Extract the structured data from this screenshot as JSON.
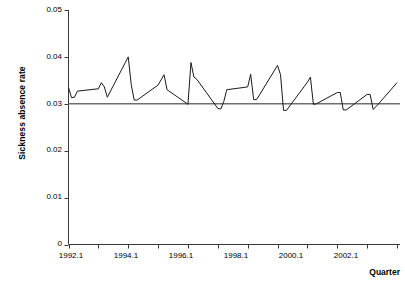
{
  "chart_data": {
    "type": "line",
    "title": "",
    "xlabel": "Quarter",
    "ylabel": "Sickness absence rate",
    "ylim": [
      0,
      0.05
    ],
    "xlim": [
      1992.1,
      2003.2
    ],
    "grid": false,
    "legend": "none",
    "y_ticks": [
      "0",
      "0.01",
      "0.02",
      "0.03",
      "0.04",
      "0.05"
    ],
    "y_tick_values": [
      0,
      0.01,
      0.02,
      0.03,
      0.04,
      0.05
    ],
    "x_ticks": [
      "1992.1",
      "1994.1",
      "1996.1",
      "1998.1",
      "2000.1",
      "2002.1"
    ],
    "x_tick_values": [
      1992.1,
      1994.1,
      1996.1,
      1998.1,
      2000.1,
      2002.1
    ],
    "reference_line": {
      "name": "mean-reference-line",
      "orientation": "horizontal",
      "value": 0.03,
      "color": "#6e6e6e"
    },
    "series": [
      {
        "name": "Sickness absence rate",
        "color": "#1a1a1a",
        "x": [
          1992.1,
          1992.2,
          1992.3,
          1992.4,
          1993.1,
          1993.2,
          1993.3,
          1993.4,
          1994.1,
          1994.2,
          1994.3,
          1994.4,
          1995.1,
          1995.2,
          1995.3,
          1995.4,
          1996.1,
          1996.2,
          1996.3,
          1996.4,
          1997.1,
          1997.2,
          1997.3,
          1997.4,
          1998.1,
          1998.2,
          1998.3,
          1998.4,
          1999.1,
          1999.2,
          1999.3,
          1999.4,
          2000.1,
          2000.2,
          2000.3,
          2000.4,
          2001.1,
          2001.2,
          2001.3,
          2001.4,
          2002.1,
          2002.2,
          2002.3,
          2002.4,
          2003.1
        ],
        "values": [
          0.0335,
          0.0313,
          0.0314,
          0.0327,
          0.0332,
          0.0345,
          0.0336,
          0.0314,
          0.04,
          0.0341,
          0.0308,
          0.0308,
          0.034,
          0.0351,
          0.0362,
          0.033,
          0.0299,
          0.0388,
          0.0357,
          0.0352,
          0.029,
          0.0289,
          0.0305,
          0.033,
          0.0336,
          0.0363,
          0.0309,
          0.0309,
          0.0382,
          0.0362,
          0.0286,
          0.0286,
          0.0346,
          0.0357,
          0.0299,
          0.03,
          0.0324,
          0.0324,
          0.0287,
          0.0287,
          0.032,
          0.032,
          0.0288,
          0.0294,
          0.0345
        ]
      }
    ]
  }
}
